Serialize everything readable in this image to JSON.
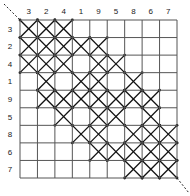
{
  "diagram": {
    "type": "symmetric-relation-matrix",
    "column_labels": [
      "3",
      "2",
      "4",
      "1",
      "9",
      "5",
      "8",
      "6",
      "7"
    ],
    "row_labels": [
      "3",
      "2",
      "4",
      "1",
      "9",
      "5",
      "8",
      "6",
      "7"
    ],
    "marked_cells": [
      [
        0,
        1,
        2
      ],
      [
        0,
        1,
        2,
        3,
        4
      ],
      [
        0,
        1,
        2,
        4,
        5
      ],
      [
        1,
        3,
        4,
        6
      ],
      [
        1,
        2,
        3,
        4,
        5,
        6,
        7
      ],
      [
        2,
        4,
        5,
        7
      ],
      [
        3,
        4,
        6,
        7,
        8
      ],
      [
        4,
        5,
        6,
        7,
        8
      ],
      [
        6,
        7,
        8
      ]
    ],
    "mark_symbol": "X",
    "diagonal": "dashed",
    "colors": {
      "grid": "#555555",
      "mark": "#111111",
      "label": "#222222"
    }
  }
}
